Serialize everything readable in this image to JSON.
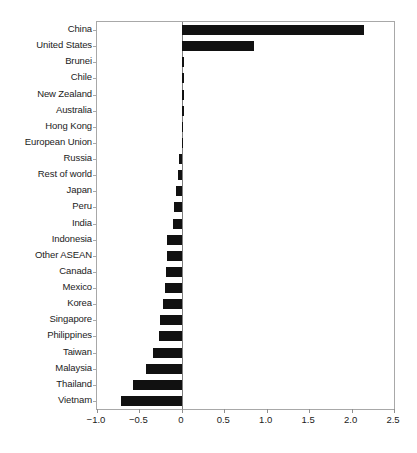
{
  "chart_data": {
    "type": "bar",
    "orientation": "horizontal",
    "title": "",
    "subtitle": "",
    "xlabel": "",
    "ylabel": "",
    "xlim": [
      -1.0,
      2.5
    ],
    "ylim": null,
    "grid": false,
    "legend": null,
    "legend_position": "none",
    "bar_color": "#111111",
    "axis_color": "#a8a8a8",
    "xticks": [
      -1.0,
      -0.5,
      0,
      0.5,
      1.0,
      1.5,
      2.0,
      2.5
    ],
    "xticklabels": [
      "−1.0",
      "−0.5",
      "0",
      "0.5",
      "1.0",
      "1.5",
      "2.0",
      "2.5"
    ],
    "categories": [
      "China",
      "United States",
      "Brunei",
      "Chile",
      "New Zealand",
      "Australia",
      "Hong Kong",
      "European Union",
      "Russia",
      "Rest of world",
      "Japan",
      "Peru",
      "India",
      "Indonesia",
      "Other ASEAN",
      "Canada",
      "Mexico",
      "Korea",
      "Singapore",
      "Philippines",
      "Taiwan",
      "Malaysia",
      "Thailand",
      "Vietnam"
    ],
    "values": [
      2.15,
      0.85,
      0.03,
      0.03,
      0.02,
      0.02,
      0.005,
      0.005,
      -0.03,
      -0.04,
      -0.07,
      -0.09,
      -0.1,
      -0.17,
      -0.17,
      -0.19,
      -0.2,
      -0.22,
      -0.26,
      -0.27,
      -0.34,
      -0.42,
      -0.58,
      -0.72
    ]
  }
}
